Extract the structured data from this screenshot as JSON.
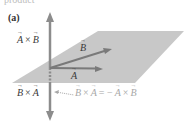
{
  "figure": {
    "cut_caption": "product",
    "panel": "(a)",
    "labels": {
      "axb": {
        "v1": "A",
        "op": "×",
        "v2": "B"
      },
      "bxa": {
        "v1": "B",
        "op": "×",
        "v2": "A"
      },
      "vec_b": "B",
      "vec_a": "A",
      "equation": {
        "lhs_v1": "B",
        "lhs_op": "×",
        "lhs_v2": "A",
        "eq": "= −",
        "rhs_v1": "A",
        "rhs_op": "×",
        "rhs_v2": "B"
      }
    },
    "colors": {
      "plane": "#c8c8c8",
      "axis": "#8c8c8c",
      "vector": "#7a7a7a",
      "label_dark": "#3a3a3a",
      "label_light": "#a8a8a8"
    }
  }
}
